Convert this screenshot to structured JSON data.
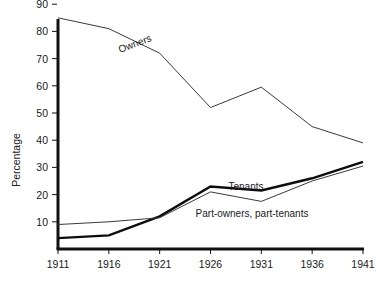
{
  "chart_data": {
    "type": "line",
    "title": "",
    "xlabel": "",
    "ylabel": "Percentage",
    "categories": [
      "1911",
      "1916",
      "1921",
      "1926",
      "1931",
      "1936",
      "1941"
    ],
    "x": [
      1911,
      1916,
      1921,
      1926,
      1931,
      1936,
      1941
    ],
    "xlim": [
      1911,
      1941
    ],
    "ylim": [
      0,
      90
    ],
    "yticks": [
      10,
      20,
      30,
      40,
      50,
      60,
      70,
      80,
      90
    ],
    "ytick_labels": [
      "10",
      "20",
      "30",
      "40",
      "50",
      "60",
      "70",
      "80",
      "90"
    ],
    "xtick_labels": [
      "1911",
      "1916",
      "1921",
      "1926",
      "1931",
      "1936",
      "1941"
    ],
    "grid": false,
    "legend": "inline-labels",
    "series": [
      {
        "name": "Owners",
        "label": "Owners",
        "style": "thin",
        "color": "#3a3a3a",
        "values": [
          85,
          81,
          72,
          52,
          59.5,
          45,
          39
        ]
      },
      {
        "name": "Tenants",
        "label": "Tenants",
        "style": "thick",
        "color": "#0d0d0d",
        "values": [
          4,
          5,
          12,
          23,
          21.5,
          26,
          32
        ]
      },
      {
        "name": "Part-owners, part-tenants",
        "label": "Part-owners, part-tenants",
        "style": "thin",
        "color": "#3a3a3a",
        "values": [
          9,
          10,
          11.5,
          21,
          17.5,
          25,
          30.5
        ]
      }
    ],
    "annotations": [
      {
        "text": "Owners",
        "series": "Owners",
        "rotation": -21
      },
      {
        "text": "Tenants",
        "series": "Tenants",
        "rotation": 0
      },
      {
        "text": "Part-owners, part-tenants",
        "series": "Part-owners, part-tenants",
        "rotation": 0
      }
    ]
  },
  "axes": {
    "y_title": "Percentage"
  }
}
